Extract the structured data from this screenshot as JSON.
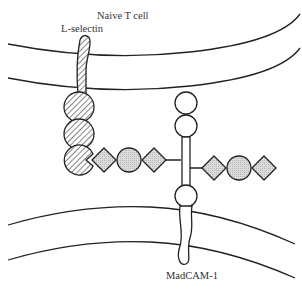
{
  "diagram": {
    "labels": {
      "naive_t_cell": "Naive T cell",
      "l_selectin": "L-selectin",
      "madcam": "MadCAM-1"
    },
    "colors": {
      "line": "#222222",
      "domain_fill_gray": "#d2d2d2",
      "hatch": "#444444",
      "background": "#ffffff"
    },
    "components": [
      {
        "name": "T cell membrane",
        "type": "lipid bilayer (top)"
      },
      {
        "name": "Endothelial membrane",
        "type": "lipid bilayer (bottom)"
      },
      {
        "name": "L-selectin",
        "domains": [
          "transmembrane stalk",
          "hatched domain",
          "hatched domain",
          "lectin domain (binding)"
        ]
      },
      {
        "name": "MadCAM-1",
        "domains": [
          "Ig domain",
          "Ig domain",
          "mucin stalk",
          "Ig domain",
          "transmembrane tail"
        ]
      },
      {
        "name": "Carbohydrate chains",
        "units": [
          "diamond",
          "circle",
          "diamond"
        ]
      }
    ]
  }
}
